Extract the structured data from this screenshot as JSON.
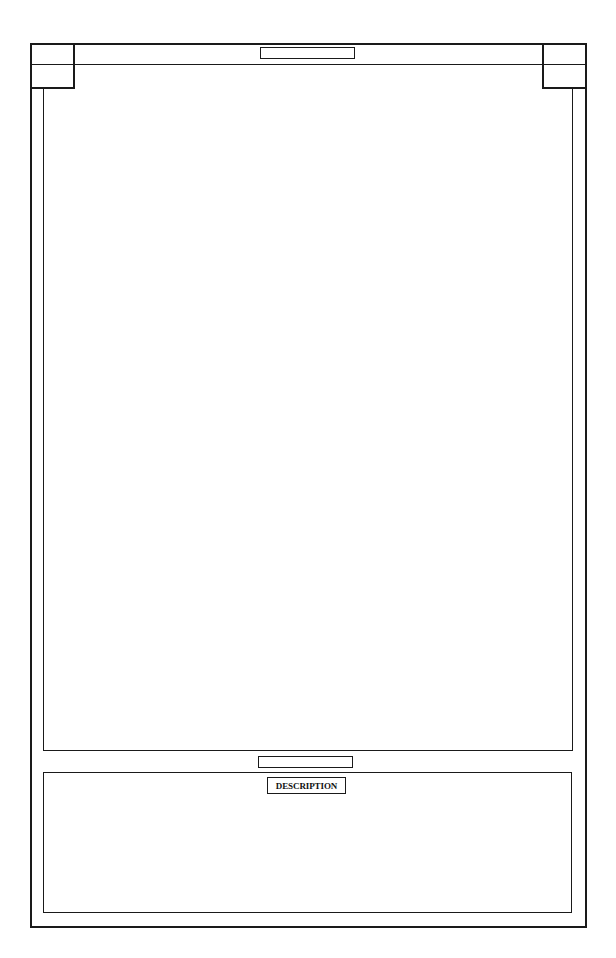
{
  "document": {
    "type": "form-template",
    "header": {
      "title_field": ""
    },
    "main_panel": {
      "content": ""
    },
    "caption_field": "",
    "description": {
      "label": "DESCRIPTION",
      "content": ""
    }
  },
  "colors": {
    "line": "#1a1a1a",
    "background": "#ffffff"
  }
}
